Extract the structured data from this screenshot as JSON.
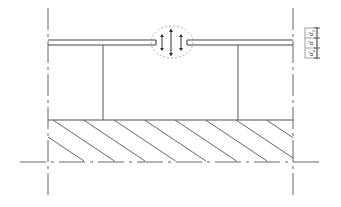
{
  "diagram": {
    "dimension_labels": [
      {
        "base": "d",
        "sub": "1"
      },
      {
        "base": "d",
        "sub": ""
      },
      {
        "base": "d",
        "sub": "a"
      }
    ],
    "hatch_count": 8,
    "colors": {
      "line": "#555555",
      "background": "#ffffff"
    }
  }
}
